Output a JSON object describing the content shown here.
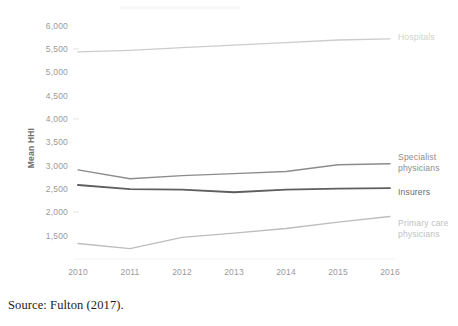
{
  "figure": {
    "caption": "Source: Fulton (2017)."
  },
  "chart_data": {
    "type": "line",
    "title": "",
    "xlabel": "",
    "ylabel": "Mean HHI",
    "x": [
      2010,
      2011,
      2012,
      2013,
      2014,
      2015,
      2016
    ],
    "xtick_labels": [
      "2010",
      "2011",
      "2012",
      "2013",
      "2014",
      "2015",
      "2016"
    ],
    "ytick_labels": [
      "1,500",
      "2,000",
      "2,500",
      "3,000",
      "3,500",
      "4,000",
      "4,500",
      "5,000",
      "5,500",
      "6,000"
    ],
    "ytick_values": [
      1500,
      2000,
      2500,
      3000,
      3500,
      4000,
      4500,
      5000,
      5500,
      6000
    ],
    "ylim": [
      1500,
      6000
    ],
    "xlim": [
      2010,
      2016
    ],
    "grid": false,
    "legend_position": "right-of-line-end",
    "series": [
      {
        "name": "Hospitals",
        "label_lines": [
          "Hospitals"
        ],
        "color": "#cccccc",
        "values": [
          5500,
          5530,
          5580,
          5630,
          5680,
          5730,
          5750
        ]
      },
      {
        "name": "Specialist physicians",
        "label_lines": [
          "Specialist",
          "physicians"
        ],
        "color": "#8c8c8c",
        "values": [
          3220,
          3050,
          3110,
          3150,
          3190,
          3320,
          3340
        ]
      },
      {
        "name": "Insurers",
        "label_lines": [
          "Insurers"
        ],
        "color": "#5f5f5f",
        "values": [
          2930,
          2850,
          2840,
          2790,
          2840,
          2860,
          2870
        ]
      },
      {
        "name": "Primary care physicians",
        "label_lines": [
          "Primary care",
          "physicians"
        ],
        "color": "#bdbdbd",
        "values": [
          1800,
          1700,
          1920,
          2000,
          2090,
          2210,
          2320
        ]
      }
    ]
  }
}
